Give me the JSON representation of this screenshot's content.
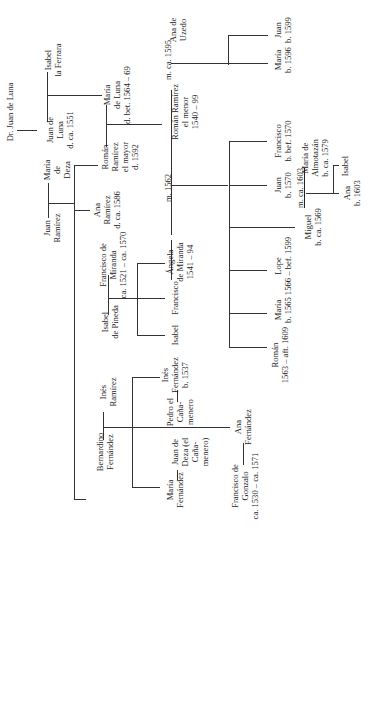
{
  "diagram": {
    "type": "family-tree",
    "orientation": "rotated -90deg (text reads bottom-to-top)",
    "people": [
      {
        "id": "dr_juan_de_luna",
        "text": "Dr. Juan de Luna",
        "x": 10,
        "y": 112
      },
      {
        "id": "juan_de_luna",
        "text": "Juan de\nLuna\nd. ca. 1551",
        "x": 60,
        "y": 130
      },
      {
        "id": "isabel_la_ferrara",
        "text": "Isabel\nla Ferrara",
        "x": 53,
        "y": 60
      },
      {
        "id": "maria_de_luna",
        "text": "María\nde Luna\nd. bet. 1564 – 69",
        "x": 117,
        "y": 95
      },
      {
        "id": "roman_ramirez_mayor",
        "text": "Román\nRamírez\nel mayor\nd. 1592",
        "x": 120,
        "y": 157
      },
      {
        "id": "juan_ramirez",
        "text": "Juan\nRamírez",
        "x": 52,
        "y": 228
      },
      {
        "id": "maria_de_deza",
        "text": "María\nde\nDeza",
        "x": 57,
        "y": 170
      },
      {
        "id": "ana_ramirez",
        "text": "Ana\nRamírez\nd. ca. 1586",
        "x": 107,
        "y": 210
      },
      {
        "id": "roman_ramirez_menor",
        "text": "Román Ramírez\nel menor\n1540 – 99",
        "x": 185,
        "y": 112
      },
      {
        "id": "ana_de_uzedo",
        "text": "Ana de\nUzedo",
        "x": 178,
        "y": 30
      },
      {
        "id": "maria_1596",
        "text": "María\nb. 1596",
        "x": 283,
        "y": 60
      },
      {
        "id": "juan_1599",
        "text": "Juan\nb. 1599",
        "x": 283,
        "y": 30
      },
      {
        "id": "francisco_de_miranda",
        "text": "Francisco de\nMiranda\nca. 1521 – ca. 1570",
        "x": 113,
        "y": 265
      },
      {
        "id": "isabel_de_pineda",
        "text": "Isabel\nde Pineda",
        "x": 110,
        "y": 322
      },
      {
        "id": "angela_de_miranda",
        "text": "Ángela\nde Miranda\n1541 – 94",
        "x": 180,
        "y": 262
      },
      {
        "id": "francisco_sib",
        "text": "Francisco",
        "x": 175,
        "y": 295
      },
      {
        "id": "isabel_sib",
        "text": "Isabel",
        "x": 175,
        "y": 335
      },
      {
        "id": "francisco_bef1570",
        "text": "Francisco\nb. bef. 1570",
        "x": 283,
        "y": 143
      },
      {
        "id": "juan_1570",
        "text": "Juan\nb. 1570",
        "x": 283,
        "y": 185
      },
      {
        "id": "miguel",
        "text": "Miguel\nb. ca. 1569",
        "x": 313,
        "y": 227
      },
      {
        "id": "maria_de_almotazan",
        "text": "María de\nAlmotazán\nb. ca. 1579",
        "x": 315,
        "y": 158
      },
      {
        "id": "isabel_daughter",
        "text": "Isabel",
        "x": 345,
        "y": 166
      },
      {
        "id": "ana_1603",
        "text": "Ana\nb. 1603",
        "x": 352,
        "y": 193
      },
      {
        "id": "lope",
        "text": "Lope\n1566 – bef. 1599",
        "x": 283,
        "y": 262
      },
      {
        "id": "maria_1565",
        "text": "María\nb. 1565",
        "x": 283,
        "y": 303
      },
      {
        "id": "roman_1563",
        "text": "Román\n1563 – aft. 1609",
        "x": 280,
        "y": 355
      },
      {
        "id": "ines_ramirez",
        "text": "Inés\nRamírez",
        "x": 108,
        "y": 392
      },
      {
        "id": "ines_fernandez",
        "text": "Inés\nFernández\nb. 1537",
        "x": 175,
        "y": 378
      },
      {
        "id": "pedro_el_canamenero",
        "text": "Pedro el\nCaña-\nmenero",
        "x": 180,
        "y": 410
      },
      {
        "id": "bernardino_fernandez",
        "text": "Bernardino\nFernández",
        "x": 105,
        "y": 450
      },
      {
        "id": "juan_de_deza",
        "text": "Juan de\nDeza (el\nCaña-\nmenero)",
        "x": 190,
        "y": 452
      },
      {
        "id": "maria_fernandez",
        "text": "María\nFernández",
        "x": 175,
        "y": 488
      },
      {
        "id": "ana_fernandez",
        "text": "Ana\nFernández",
        "x": 243,
        "y": 427
      },
      {
        "id": "francisco_de_gonzalo",
        "text": "Francisco de\nGonzalo\nca. 1530 – ca. 1571",
        "x": 245,
        "y": 484
      }
    ],
    "marriage_labels": [
      {
        "id": "m_1595",
        "text": "m. ca. 1595",
        "x": 168,
        "y": 60,
        "underline": false
      },
      {
        "id": "m_1562",
        "text": "m. 1562",
        "x": 168,
        "y": 188,
        "underline": false
      },
      {
        "id": "m_1603",
        "text": "m. ca. 1603",
        "x": 300,
        "y": 188,
        "underline": true
      }
    ]
  }
}
